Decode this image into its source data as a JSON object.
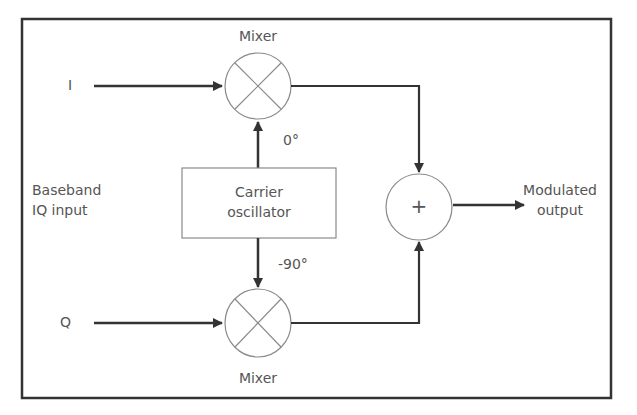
{
  "diagram": {
    "labels": {
      "i_input": "I",
      "q_input": "Q",
      "baseband_line1": "Baseband",
      "baseband_line2": "IQ input",
      "mixer_top": "Mixer",
      "mixer_bottom": "Mixer",
      "carrier_line1": "Carrier",
      "carrier_line2": "oscillator",
      "phase_0": "0°",
      "phase_90": "-90°",
      "adder_symbol": "+",
      "output_line1": "Modulated",
      "output_line2": "output"
    },
    "colors": {
      "line": "#333333",
      "shape_stroke": "#8a8a8a",
      "text": "#555555"
    }
  }
}
